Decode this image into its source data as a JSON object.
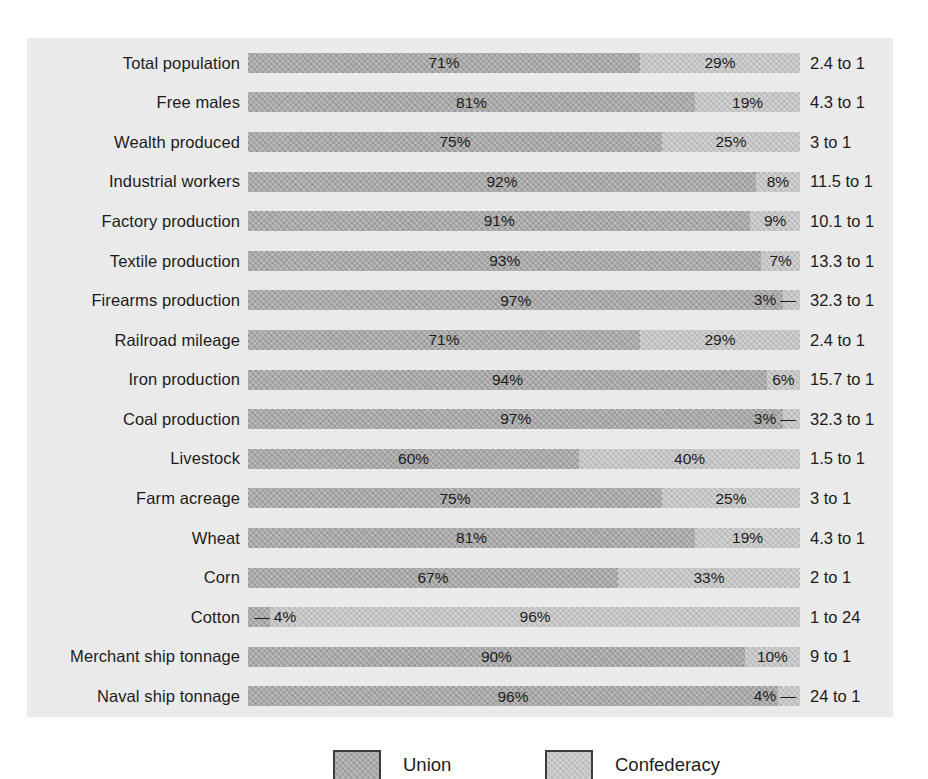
{
  "colors": {
    "union": "#a8a8a8",
    "confederacy": "#c6c6c6",
    "panel_bg": "#eaeaea",
    "page_bg": "#ffffff",
    "text": "#1f1f1f"
  },
  "legend": {
    "union_label": "Union",
    "confederacy_label": "Confederacy"
  },
  "chart_data": {
    "type": "bar",
    "orientation": "horizontal",
    "stacked": true,
    "unit": "%",
    "title": "",
    "xlabel": "",
    "ylabel": "",
    "xlim": [
      0,
      100
    ],
    "grid": false,
    "legend_position": "bottom",
    "legend_entries": [
      "Union",
      "Confederacy"
    ],
    "categories": [
      "Total population",
      "Free males",
      "Wealth produced",
      "Industrial workers",
      "Factory production",
      "Textile production",
      "Firearms production",
      "Railroad mileage",
      "Iron production",
      "Coal production",
      "Livestock",
      "Farm acreage",
      "Wheat",
      "Corn",
      "Cotton",
      "Merchant ship tonnage",
      "Naval ship tonnage"
    ],
    "series": [
      {
        "name": "Union",
        "values": [
          71,
          81,
          75,
          92,
          91,
          93,
          97,
          71,
          94,
          97,
          60,
          75,
          81,
          67,
          4,
          90,
          96
        ]
      },
      {
        "name": "Confederacy",
        "values": [
          29,
          19,
          25,
          8,
          9,
          7,
          3,
          29,
          6,
          3,
          40,
          25,
          19,
          33,
          96,
          10,
          4
        ]
      }
    ],
    "rows": [
      {
        "category": "Total population",
        "union": 71,
        "confederacy": 29,
        "ratio": "2.4 to 1"
      },
      {
        "category": "Free males",
        "union": 81,
        "confederacy": 19,
        "ratio": "4.3 to 1"
      },
      {
        "category": "Wealth produced",
        "union": 75,
        "confederacy": 25,
        "ratio": "3 to 1"
      },
      {
        "category": "Industrial workers",
        "union": 92,
        "confederacy": 8,
        "ratio": "11.5 to 1"
      },
      {
        "category": "Factory production",
        "union": 91,
        "confederacy": 9,
        "ratio": "10.1 to 1"
      },
      {
        "category": "Textile production",
        "union": 93,
        "confederacy": 7,
        "ratio": "13.3 to 1"
      },
      {
        "category": "Firearms production",
        "union": 97,
        "confederacy": 3,
        "ratio": "32.3 to 1"
      },
      {
        "category": "Railroad mileage",
        "union": 71,
        "confederacy": 29,
        "ratio": "2.4 to 1"
      },
      {
        "category": "Iron production",
        "union": 94,
        "confederacy": 6,
        "ratio": "15.7 to 1"
      },
      {
        "category": "Coal production",
        "union": 97,
        "confederacy": 3,
        "ratio": "32.3 to 1"
      },
      {
        "category": "Livestock",
        "union": 60,
        "confederacy": 40,
        "ratio": "1.5 to 1"
      },
      {
        "category": "Farm acreage",
        "union": 75,
        "confederacy": 25,
        "ratio": "3 to 1"
      },
      {
        "category": "Wheat",
        "union": 81,
        "confederacy": 19,
        "ratio": "4.3 to 1"
      },
      {
        "category": "Corn",
        "union": 67,
        "confederacy": 33,
        "ratio": "2 to 1"
      },
      {
        "category": "Cotton",
        "union": 4,
        "confederacy": 96,
        "ratio": "1 to 24"
      },
      {
        "category": "Merchant ship tonnage",
        "union": 90,
        "confederacy": 10,
        "ratio": "9 to 1"
      },
      {
        "category": "Naval ship tonnage",
        "union": 96,
        "confederacy": 4,
        "ratio": "24 to 1"
      }
    ],
    "small_label_dash": "—",
    "small_label_threshold_pct": 6
  }
}
